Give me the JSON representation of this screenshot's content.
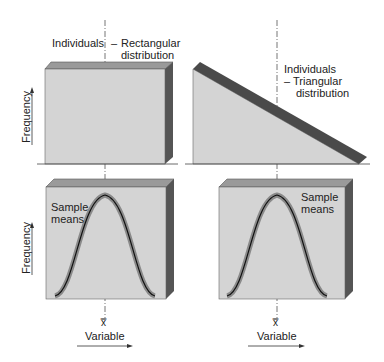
{
  "figure": {
    "panels": [
      {
        "id": "top-left",
        "label_line1": "Individuals",
        "label_line2": "Rectangular",
        "label_line3": "distribution",
        "dash": "–",
        "shape": "rectangular"
      },
      {
        "id": "top-right",
        "label_line1": "Individuals",
        "label_line2": "– Triangular",
        "label_line3": "distribution",
        "shape": "triangular"
      },
      {
        "id": "bottom-left",
        "label_line1": "Sample",
        "label_line2": "means",
        "shape": "normal"
      },
      {
        "id": "bottom-right",
        "label_line1": "Sample",
        "label_line2": "means",
        "shape": "normal"
      }
    ],
    "axes": {
      "y_label": "Frequency",
      "x_label": "Variable",
      "mean_symbol": "x̿"
    },
    "colors": {
      "face": "#d4d4d4",
      "top_bevel": "#9a9a9a",
      "side": "#555555",
      "stripe": "#4a4a4a",
      "curve_outer": "#8a8a8a",
      "curve_inner": "#111111",
      "dash": "#777777"
    }
  }
}
